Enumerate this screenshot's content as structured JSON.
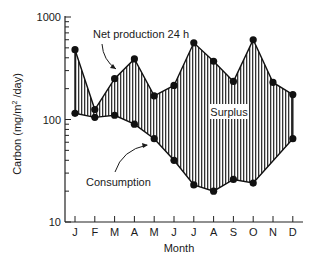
{
  "chart_data": {
    "type": "area",
    "title": "",
    "xlabel": "Month",
    "ylabel": "Carbon (mg/m² /day)",
    "yscale": "log",
    "ylim": [
      10,
      1000
    ],
    "yticks": [
      {
        "value": 10,
        "label": "10"
      },
      {
        "value": 100,
        "label": "100"
      },
      {
        "value": 1000,
        "label": "1000"
      }
    ],
    "categories": [
      "J",
      "F",
      "M",
      "A",
      "M",
      "J",
      "J",
      "A",
      "S",
      "O",
      "N",
      "D"
    ],
    "series": [
      {
        "name": "Net production 24 h",
        "values": [
          480,
          125,
          250,
          390,
          170,
          215,
          560,
          370,
          235,
          600,
          230,
          175
        ]
      },
      {
        "name": "Consumption",
        "values": [
          115,
          105,
          110,
          90,
          65,
          40,
          23,
          20,
          26,
          24,
          null,
          65
        ]
      }
    ],
    "fill_between_label": "Surplus",
    "annotations": [
      {
        "text": "Net production 24 h",
        "target_series": "Net production 24 h"
      },
      {
        "text": "Surplus"
      },
      {
        "text": "Consumption",
        "target_series": "Consumption"
      }
    ],
    "grid": false,
    "legend": "none"
  },
  "labels": {
    "y_axis": "Carbon (mg/m",
    "y_axis_sup": "2",
    "y_axis_end": " /day)",
    "x_axis": "Month",
    "net_production": "Net production 24 h",
    "surplus": "Surplus",
    "consumption": "Consumption"
  }
}
